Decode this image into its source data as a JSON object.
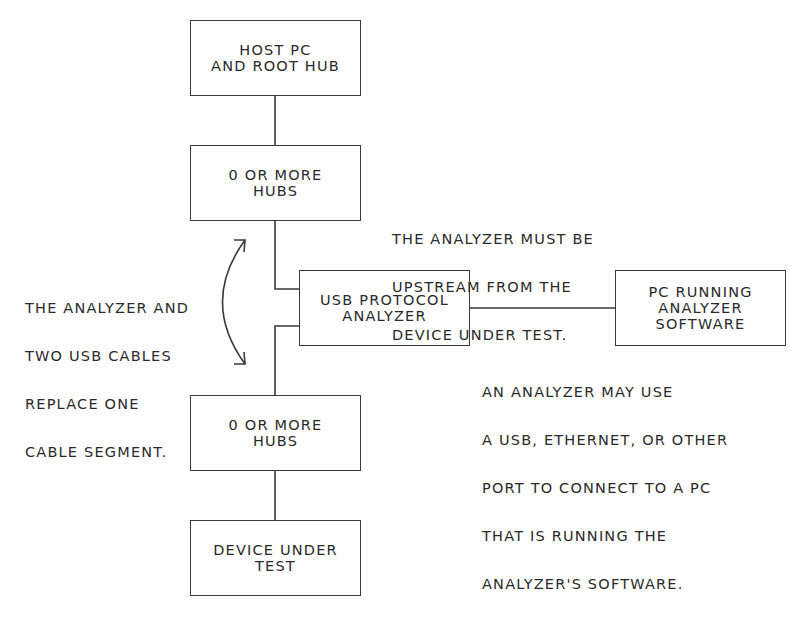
{
  "diagram": {
    "nodes": {
      "host": {
        "lines": [
          "HOST PC",
          "AND ROOT HUB"
        ]
      },
      "hubs_upper": {
        "lines": [
          "0 OR MORE",
          "HUBS"
        ]
      },
      "analyzer": {
        "lines": [
          "USB PROTOCOL",
          "ANALYZER"
        ]
      },
      "pc_software": {
        "lines": [
          "PC RUNNING",
          "ANALYZER",
          "SOFTWARE"
        ]
      },
      "hubs_lower": {
        "lines": [
          "0 OR MORE",
          "HUBS"
        ]
      },
      "device": {
        "lines": [
          "DEVICE UNDER",
          "TEST"
        ]
      }
    },
    "edges": [
      {
        "from": "host",
        "to": "hubs_upper"
      },
      {
        "from": "hubs_upper",
        "to": "analyzer"
      },
      {
        "from": "analyzer",
        "to": "hubs_lower"
      },
      {
        "from": "analyzer",
        "to": "pc_software"
      },
      {
        "from": "hubs_lower",
        "to": "device"
      }
    ],
    "notes": {
      "upstream": [
        "THE ANALYZER MUST BE",
        "UPSTREAM FROM THE",
        "DEVICE UNDER TEST."
      ],
      "replace": [
        "THE ANALYZER AND",
        "TWO USB CABLES",
        "REPLACE ONE",
        "CABLE SEGMENT."
      ],
      "port": [
        "AN ANALYZER MAY USE",
        "A USB, ETHERNET, OR OTHER",
        "PORT TO CONNECT TO A PC",
        "THAT IS RUNNING THE",
        "ANALYZER'S SOFTWARE."
      ]
    },
    "colors": {
      "stroke": "#3a3a3a",
      "text": "#2a2a2a",
      "background": "#ffffff"
    }
  }
}
